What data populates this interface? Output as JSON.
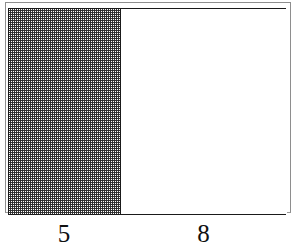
{
  "figure": {
    "type": "partitioned-rectangle-diagram",
    "frame": {
      "outline_color": "#1a1a1a",
      "shadow_outline_color": "#8e8e8e",
      "fill_color": "#ffffff"
    },
    "parts": [
      {
        "id": "left-region",
        "label": "5",
        "fill": "stippled",
        "fill_color": "#282828",
        "background_color": "#ffffff"
      },
      {
        "id": "right-region",
        "label": "8",
        "fill": "plain",
        "fill_color": "#ffffff",
        "background_color": "#ffffff"
      }
    ],
    "labels": {
      "left_width": "5",
      "right_width": "8"
    }
  },
  "chart_data": {
    "type": "bar",
    "title": "",
    "xlabel": "",
    "ylabel": "",
    "orientation": "horizontal-segments",
    "categories": [
      "5",
      "8"
    ],
    "values": [
      5,
      8
    ],
    "total": 13,
    "grid": false,
    "legend": null,
    "annotations": [
      "5",
      "8"
    ]
  }
}
